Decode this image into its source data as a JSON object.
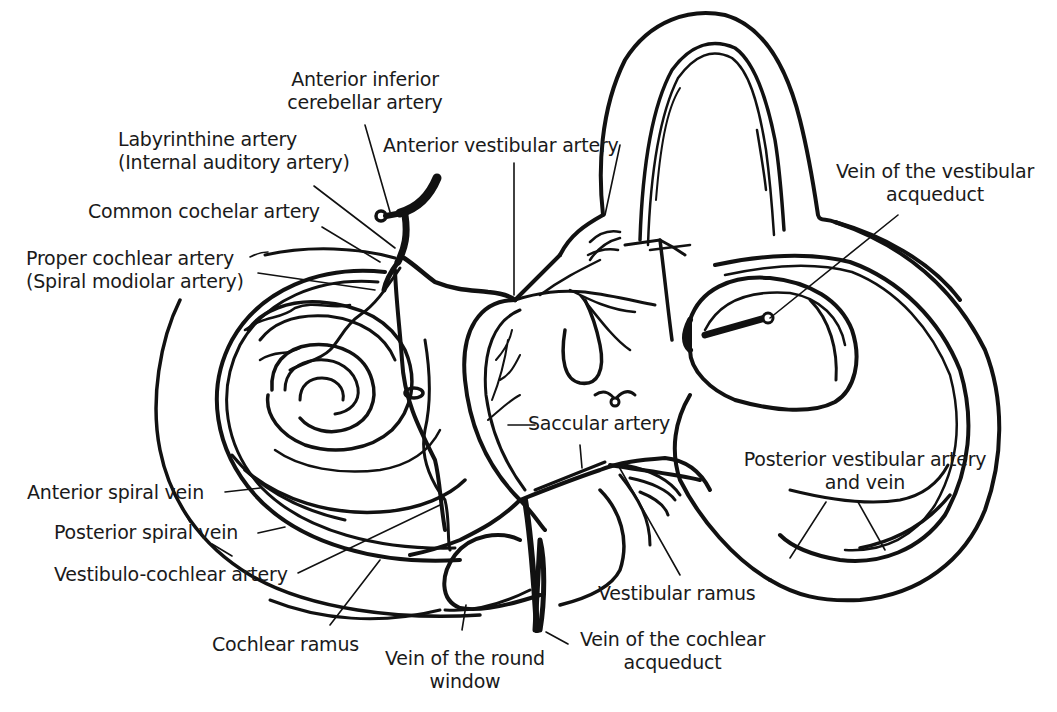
{
  "diagram": {
    "colors": {
      "ink": "#111111",
      "background": "#ffffff"
    },
    "labels": {
      "aica_1": "Anterior inferior",
      "aica_2": "cerebellar artery",
      "labyrinthine_1": "Labyrinthine artery",
      "labyrinthine_2": "(Internal auditory artery)",
      "anterior_vestibular": "Anterior vestibular artery",
      "common_cochlear": "Common cochelar artery",
      "proper_cochlear_1": "Proper cochlear artery",
      "proper_cochlear_2": "(Spiral modiolar artery)",
      "vein_vestibular_aq_1": "Vein of the vestibular",
      "vein_vestibular_aq_2": "acqueduct",
      "saccular": "Saccular artery",
      "posterior_vestibular_1": "Posterior vestibular artery",
      "posterior_vestibular_2": "and vein",
      "anterior_spiral_vein": "Anterior spiral vein",
      "posterior_spiral_vein": "Posterior spiral vein",
      "vestibulo_cochlear": "Vestibulo-cochlear artery",
      "vestibular_ramus": "Vestibular ramus",
      "cochlear_ramus": "Cochlear ramus",
      "vein_round_window_1": "Vein of the round",
      "vein_round_window_2": "window",
      "vein_cochlear_aq_1": "Vein of the cochlear",
      "vein_cochlear_aq_2": "acqueduct"
    }
  }
}
